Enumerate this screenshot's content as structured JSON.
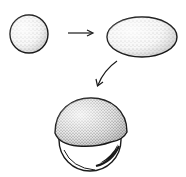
{
  "diagram": {
    "colors": {
      "stroke": "#1a1a1a",
      "fill": "#f4f4f4",
      "stipple": "#555555",
      "background": "#ffffff"
    },
    "shapes": [
      {
        "id": "sphere",
        "type": "circle",
        "cx": 29,
        "cy": 34,
        "r": 19
      },
      {
        "id": "ellipsoid",
        "type": "ellipse",
        "cx": 142,
        "cy": 37,
        "rx": 35,
        "ry": 20
      },
      {
        "id": "dome",
        "type": "dome",
        "x1": 55,
        "x2": 127,
        "top": 98,
        "base": 145
      },
      {
        "id": "ball",
        "type": "circle",
        "cx": 90,
        "cy": 140,
        "r": 31
      }
    ],
    "arrows": [
      {
        "id": "arrow-right",
        "from": [
          68,
          33
        ],
        "to": [
          93,
          33
        ],
        "style": "straight"
      },
      {
        "id": "arrow-down-left",
        "from": [
          117,
          61
        ],
        "to": [
          97,
          86
        ],
        "style": "curved"
      }
    ]
  }
}
